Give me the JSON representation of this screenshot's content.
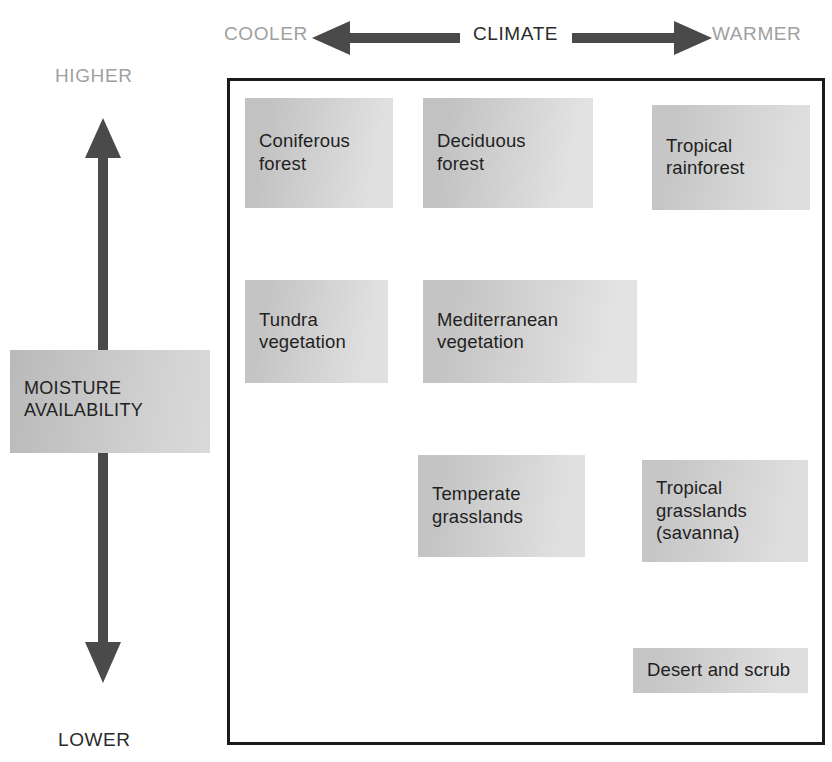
{
  "diagram": {
    "background_color": "#ffffff",
    "frame_color": "#1a1a1a"
  },
  "axes": {
    "horizontal": {
      "name": "CLIMATE",
      "left_end_label": "COOLER",
      "right_end_label": "WARMER",
      "left_arrow_icon": "arrow-left-icon",
      "right_arrow_icon": "arrow-right-icon",
      "end_label_color": "#a0a0a0",
      "name_color": "#2b2b2b",
      "arrow_color": "#4a4a4a"
    },
    "vertical": {
      "name": "MOISTURE\nAVAILABILITY",
      "top_end_label": "HIGHER",
      "bottom_end_label": "LOWER",
      "arrow_icon": "double-headed-vertical-arrow-icon",
      "top_label_color": "#a0a0a0",
      "bottom_label_color": "#2b2b2b",
      "arrow_color": "#4a4a4a",
      "label_box_gradient_from": "#b9b9b9",
      "label_box_gradient_to": "#dadada"
    }
  },
  "chart_data": {
    "type": "scatter",
    "xlabel": "CLIMATE",
    "ylabel": "MOISTURE AVAILABILITY",
    "xlim": [
      "COOLER",
      "WARMER"
    ],
    "ylim": [
      "LOWER",
      "HIGHER"
    ],
    "grid": false,
    "legend": "none",
    "items": [
      {
        "label": "Coniferous\nforest",
        "climate": "cool",
        "moisture": "high",
        "x": 245,
        "y": 98,
        "w": 148,
        "h": 110,
        "fill_from": "#c2c2c2",
        "fill_to": "#e0e0e0"
      },
      {
        "label": "Deciduous\nforest",
        "climate": "temperate",
        "moisture": "high",
        "x": 423,
        "y": 98,
        "w": 170,
        "h": 110,
        "fill_from": "#c2c2c2",
        "fill_to": "#e2e2e2"
      },
      {
        "label": "Tropical\nrainforest",
        "climate": "warm",
        "moisture": "high",
        "x": 652,
        "y": 105,
        "w": 158,
        "h": 105,
        "fill_from": "#c6c6c6",
        "fill_to": "#dedede"
      },
      {
        "label": "Tundra\nvegetation",
        "climate": "cool",
        "moisture": "medium-high",
        "x": 245,
        "y": 280,
        "w": 143,
        "h": 103,
        "fill_from": "#c4c4c4",
        "fill_to": "#e0e0e0"
      },
      {
        "label": "Mediterranean\nvegetation",
        "climate": "temperate",
        "moisture": "medium-high",
        "x": 423,
        "y": 280,
        "w": 214,
        "h": 103,
        "fill_from": "#c4c4c4",
        "fill_to": "#e3e3e3"
      },
      {
        "label": "Temperate\ngrasslands",
        "climate": "temperate",
        "moisture": "medium-low",
        "x": 418,
        "y": 455,
        "w": 167,
        "h": 102,
        "fill_from": "#c4c4c4",
        "fill_to": "#e0e0e0"
      },
      {
        "label": "Tropical\ngrasslands\n(savanna)",
        "climate": "warm",
        "moisture": "medium-low",
        "x": 642,
        "y": 460,
        "w": 166,
        "h": 102,
        "fill_from": "#c6c6c6",
        "fill_to": "#dedede"
      },
      {
        "label": "Desert and scrub",
        "climate": "warm",
        "moisture": "low",
        "x": 633,
        "y": 648,
        "w": 175,
        "h": 45,
        "fill_from": "#c6c6c6",
        "fill_to": "#dedede"
      }
    ]
  }
}
